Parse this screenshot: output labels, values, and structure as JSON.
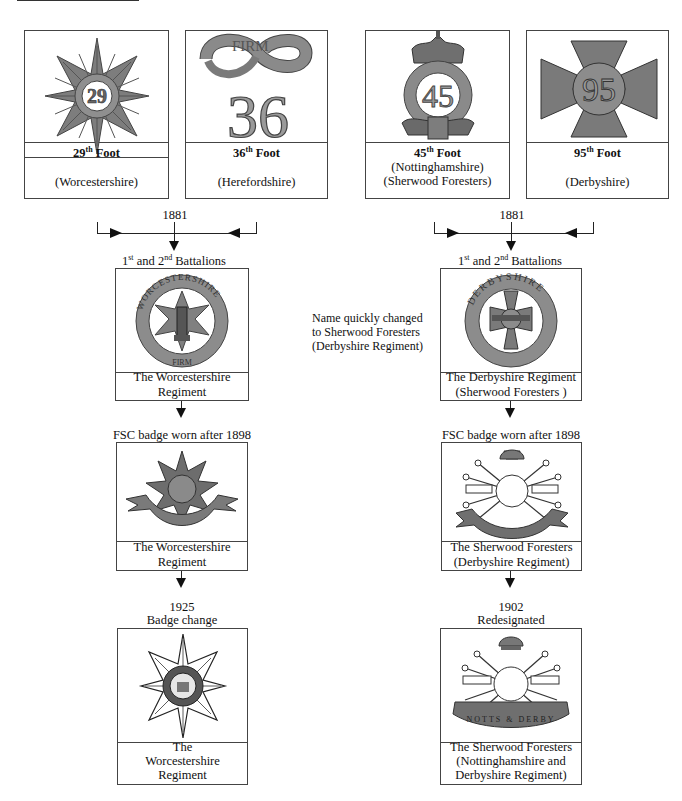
{
  "colors": {
    "badge_fill": "#8a8a8a",
    "badge_dark": "#555555",
    "badge_light": "#c8c8c8",
    "line": "#222222"
  },
  "top_row": [
    {
      "number": "29",
      "ordinal": "th",
      "title_suffix": "Foot",
      "line1": "",
      "line2": "(Worcestershire)",
      "badge": "star-badge-29-icon"
    },
    {
      "number": "36",
      "ordinal": "th",
      "title_suffix": "Foot",
      "line1": "",
      "line2": "(Herefordshire)",
      "badge": "firm-36-badge-icon",
      "motto": "FIRM"
    },
    {
      "number": "45",
      "ordinal": "th",
      "title_suffix": "Foot",
      "line1": "(Nottinghamshire)",
      "line2": "(Sherwood Foresters)",
      "badge": "crowned-45-badge-icon",
      "ring_text": "NOTTINGHAMSHIRE"
    },
    {
      "number": "95",
      "ordinal": "th",
      "title_suffix": "Foot",
      "line1": "",
      "line2": "(Derbyshire)",
      "badge": "maltese-cross-95-badge-icon"
    }
  ],
  "left_column": {
    "merge_year": "1881",
    "battalions": {
      "first": "1",
      "first_sup": "st",
      "mid": " and 2",
      "second_sup": "nd",
      "rest": " Battalions"
    },
    "box1": {
      "line1": "The  Worcestershire",
      "line2": "Regiment",
      "ring_text": "WORCESTERSHIRE",
      "motto": "FIRM"
    },
    "step2_label": "FSC badge worn after 1898",
    "box2": {
      "line1": "The   Worcestershire",
      "line2": "Regiment"
    },
    "step3_year": "1925",
    "step3_label": "Badge change",
    "box3": {
      "line1": "The",
      "line2": "Worcestershire",
      "line3": "Regiment"
    }
  },
  "right_column": {
    "merge_year": "1881",
    "battalions": {
      "first": "1",
      "first_sup": "st",
      "mid": " and 2",
      "second_sup": "nd",
      "rest": " Battalions"
    },
    "side_note": {
      "line1": "Name quickly changed",
      "line2": "to Sherwood Foresters",
      "line3": "(Derbyshire Regiment)"
    },
    "box1": {
      "line1": "The Derbyshire Regiment",
      "line2": "(Sherwood Foresters )",
      "ring_text": "DERBYSHIRE"
    },
    "step2_label": "FSC badge worn after 1898",
    "box2": {
      "line1": "The Sherwood Foresters",
      "line2": "(Derbyshire Regiment)",
      "scroll_text": "DERBYSHIRE"
    },
    "step3_year": "1902",
    "step3_label": "Redesignated",
    "box3": {
      "line1": "The Sherwood Foresters",
      "line2": "(Nottinghamshire and",
      "line3": "Derbyshire Regiment)",
      "scroll_text": "NOTTS & DERBY"
    }
  }
}
